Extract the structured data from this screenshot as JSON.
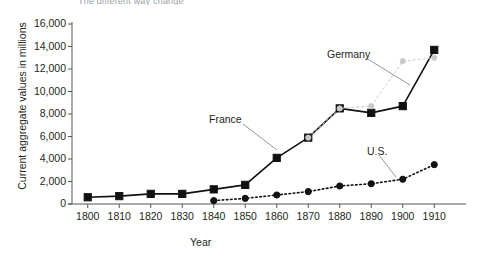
{
  "chart_data": {
    "type": "line",
    "title": "The different way change",
    "xlabel": "Year",
    "ylabel": "Current aggregate values in millions",
    "x": [
      1800,
      1810,
      1820,
      1830,
      1840,
      1850,
      1860,
      1870,
      1880,
      1890,
      1900,
      1910
    ],
    "xlim": [
      1795,
      1915
    ],
    "ylim": [
      0,
      16000
    ],
    "yticks": [
      0,
      2000,
      4000,
      6000,
      8000,
      10000,
      12000,
      14000,
      16000
    ],
    "ytick_labels": [
      "0",
      "2,000",
      "4,000",
      "6,000",
      "8,000",
      "10,000",
      "12,000",
      "14,000",
      "16,000"
    ],
    "xtick_labels": [
      "1800",
      "1810",
      "1820",
      "1830",
      "1840",
      "1850",
      "1860",
      "1870",
      "1880",
      "1890",
      "1900",
      "1910"
    ],
    "grid": false,
    "legend": "annotations",
    "series": [
      {
        "name": "France",
        "marker": "square",
        "color": "#111111",
        "linestyle": "solid",
        "x": [
          1800,
          1810,
          1820,
          1830,
          1840,
          1850,
          1860,
          1870,
          1880,
          1890,
          1900,
          1910
        ],
        "values": [
          600,
          700,
          900,
          900,
          1300,
          1700,
          4100,
          5900,
          8500,
          8100,
          8700,
          13700
        ]
      },
      {
        "name": "Germany",
        "marker": "circle",
        "color": "#c9c9c9",
        "linestyle": "dotted",
        "x": [
          1870,
          1880,
          1890,
          1900,
          1910
        ],
        "values": [
          5900,
          8500,
          8700,
          12700,
          13000
        ]
      },
      {
        "name": "U.S.",
        "marker": "circle",
        "color": "#111111",
        "linestyle": "dotted",
        "x": [
          1840,
          1850,
          1860,
          1870,
          1880,
          1890,
          1900,
          1910
        ],
        "values": [
          300,
          500,
          800,
          1100,
          1600,
          1800,
          2200,
          3500
        ]
      }
    ],
    "annotations": [
      {
        "label": "Germany",
        "series": "Germany"
      },
      {
        "label": "France",
        "series": "France"
      },
      {
        "label": "U.S.",
        "series": "U.S."
      }
    ]
  },
  "axes": {
    "ylabel": "Current aggregate values in millions",
    "xlabel": "Year"
  },
  "labels": {
    "germany": "Germany",
    "france": "France",
    "us": "U.S."
  },
  "title": "The different way change"
}
